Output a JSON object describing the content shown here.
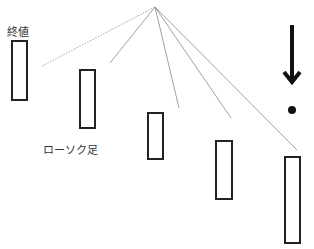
{
  "labels": {
    "close_price": "終値",
    "candlestick": "ローソク足"
  },
  "diagram": {
    "candle_count": 5,
    "candle_fill": "#ffffff",
    "candle_stroke": "#222222",
    "line_color": "#888888",
    "arrow_color": "#111111",
    "icons": [
      "down-arrow-icon",
      "dot-icon"
    ]
  }
}
